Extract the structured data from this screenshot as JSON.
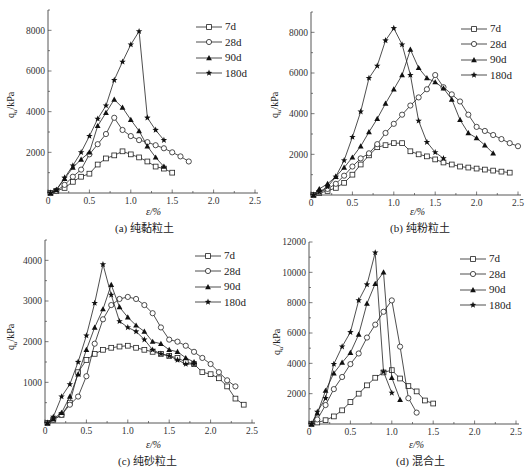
{
  "figure": {
    "panels": [
      {
        "id": "a",
        "caption": "(a) 纯黏粒土"
      },
      {
        "id": "b",
        "caption": "(b) 纯粉粒土"
      },
      {
        "id": "c",
        "caption": "(c) 纯砂粒土"
      },
      {
        "id": "d",
        "caption": "(d) 混合土"
      }
    ],
    "xlabel": "ε/%",
    "ylabel": "qu/kPa",
    "legend": [
      "7d",
      "28d",
      "90d",
      "180d"
    ],
    "markers": {
      "7d": "open-square",
      "28d": "open-circle",
      "90d": "filled-triangle",
      "180d": "filled-star"
    }
  },
  "chart_data": [
    {
      "type": "line",
      "title": "(a) 纯黏粒土",
      "xlabel": "ε/%",
      "ylabel": "qu/kPa",
      "xlim": [
        0,
        2.5
      ],
      "ylim": [
        0,
        9000
      ],
      "xticks": [
        0,
        0.5,
        1.0,
        1.5,
        2.0,
        2.5
      ],
      "yticks": [
        2000,
        4000,
        6000,
        8000
      ],
      "legend_position": "upper right",
      "series": [
        {
          "name": "7d",
          "x": [
            0.03,
            0.1,
            0.2,
            0.3,
            0.4,
            0.5,
            0.6,
            0.7,
            0.8,
            0.9,
            1.0,
            1.1,
            1.2,
            1.3,
            1.4,
            1.5
          ],
          "y": [
            0,
            100,
            250,
            550,
            800,
            950,
            1400,
            1700,
            1850,
            2050,
            1900,
            1750,
            1550,
            1300,
            1200,
            1000
          ]
        },
        {
          "name": "28d",
          "x": [
            0.03,
            0.1,
            0.2,
            0.3,
            0.4,
            0.5,
            0.6,
            0.7,
            0.8,
            0.9,
            1.0,
            1.1,
            1.2,
            1.3,
            1.4,
            1.5,
            1.6,
            1.7
          ],
          "y": [
            0,
            100,
            400,
            800,
            1150,
            1900,
            2400,
            2900,
            3700,
            3100,
            2800,
            2600,
            2500,
            2350,
            2200,
            2000,
            1800,
            1550
          ]
        },
        {
          "name": "90d",
          "x": [
            0.03,
            0.1,
            0.2,
            0.3,
            0.4,
            0.5,
            0.6,
            0.7,
            0.8,
            0.9,
            1.0,
            1.1,
            1.2,
            1.3,
            1.4
          ],
          "y": [
            0,
            150,
            700,
            1250,
            1650,
            2000,
            3300,
            3950,
            4600,
            4200,
            3600,
            3050,
            2300,
            1750,
            1300
          ]
        },
        {
          "name": "180d",
          "x": [
            0.03,
            0.1,
            0.2,
            0.3,
            0.4,
            0.5,
            0.6,
            0.7,
            0.8,
            0.9,
            1.0,
            1.1,
            1.2,
            1.3,
            1.4
          ],
          "y": [
            0,
            150,
            750,
            1350,
            2000,
            2800,
            3650,
            4300,
            5550,
            6450,
            7300,
            7950,
            3700,
            3100,
            2600
          ]
        }
      ]
    },
    {
      "type": "line",
      "title": "(b) 纯粉粒土",
      "xlabel": "ε/%",
      "ylabel": "qu/kPa",
      "xlim": [
        0,
        2.5
      ],
      "ylim": [
        0,
        9000
      ],
      "xticks": [
        0,
        0.5,
        1.0,
        1.5,
        2.0,
        2.5
      ],
      "yticks": [
        2000,
        4000,
        6000,
        8000
      ],
      "legend_position": "upper right",
      "series": [
        {
          "name": "7d",
          "x": [
            0.03,
            0.1,
            0.2,
            0.3,
            0.4,
            0.5,
            0.6,
            0.7,
            0.8,
            0.9,
            1.0,
            1.1,
            1.2,
            1.3,
            1.4,
            1.5,
            1.6,
            1.7,
            1.8,
            1.9,
            2.0,
            2.1,
            2.2,
            2.3,
            2.4
          ],
          "y": [
            0,
            100,
            200,
            350,
            600,
            1000,
            1500,
            1950,
            2350,
            2450,
            2550,
            2550,
            2150,
            2000,
            1900,
            1750,
            1600,
            1500,
            1400,
            1350,
            1300,
            1250,
            1200,
            1150,
            1100
          ]
        },
        {
          "name": "28d",
          "x": [
            0.03,
            0.1,
            0.2,
            0.3,
            0.4,
            0.5,
            0.6,
            0.7,
            0.8,
            0.9,
            1.0,
            1.1,
            1.2,
            1.3,
            1.4,
            1.5,
            1.6,
            1.7,
            1.8,
            1.9,
            2.0,
            2.1,
            2.2,
            2.3,
            2.4,
            2.5
          ],
          "y": [
            0,
            150,
            300,
            550,
            950,
            1400,
            1800,
            2050,
            2500,
            3050,
            3500,
            3950,
            4400,
            4800,
            5200,
            5900,
            5300,
            4950,
            4600,
            3950,
            3350,
            3150,
            2950,
            2750,
            2550,
            2400
          ]
        },
        {
          "name": "90d",
          "x": [
            0.03,
            0.1,
            0.2,
            0.3,
            0.4,
            0.5,
            0.6,
            0.7,
            0.8,
            0.9,
            1.0,
            1.1,
            1.2,
            1.3,
            1.4,
            1.5,
            1.6,
            1.7,
            1.8,
            1.9,
            2.0,
            2.1,
            2.2
          ],
          "y": [
            0,
            300,
            550,
            900,
            1350,
            1850,
            2400,
            3100,
            3750,
            4500,
            5200,
            5900,
            7150,
            6250,
            5750,
            5550,
            5250,
            4700,
            3700,
            3050,
            2800,
            2450,
            2050
          ]
        },
        {
          "name": "180d",
          "x": [
            0.03,
            0.1,
            0.2,
            0.3,
            0.4,
            0.5,
            0.6,
            0.7,
            0.8,
            0.9,
            1.0,
            1.1,
            1.2,
            1.3,
            1.4,
            1.5,
            1.6
          ],
          "y": [
            0,
            150,
            400,
            900,
            1700,
            2850,
            4100,
            5750,
            6350,
            7600,
            8200,
            7400,
            5900,
            3650,
            2600,
            2100,
            1800
          ]
        }
      ]
    },
    {
      "type": "line",
      "title": "(c) 纯砂粒土",
      "xlabel": "ε/%",
      "ylabel": "qu/kPa",
      "xlim": [
        0,
        2.5
      ],
      "ylim": [
        0,
        4500
      ],
      "xticks": [
        0,
        0.5,
        1.0,
        1.5,
        2.0,
        2.5
      ],
      "yticks": [
        1000,
        2000,
        3000,
        4000
      ],
      "legend_position": "upper right",
      "series": [
        {
          "name": "7d",
          "x": [
            0.03,
            0.1,
            0.2,
            0.3,
            0.4,
            0.5,
            0.6,
            0.7,
            0.8,
            0.9,
            1.0,
            1.1,
            1.2,
            1.3,
            1.4,
            1.5,
            1.6,
            1.7,
            1.8,
            1.9,
            2.0,
            2.1,
            2.2,
            2.3,
            2.4
          ],
          "y": [
            0,
            80,
            200,
            500,
            1250,
            1550,
            1700,
            1800,
            1850,
            1880,
            1900,
            1850,
            1800,
            1750,
            1700,
            1650,
            1600,
            1500,
            1450,
            1250,
            1200,
            1100,
            900,
            600,
            450
          ]
        },
        {
          "name": "28d",
          "x": [
            0.03,
            0.1,
            0.2,
            0.3,
            0.4,
            0.5,
            0.6,
            0.7,
            0.8,
            0.9,
            1.0,
            1.1,
            1.2,
            1.3,
            1.4,
            1.5,
            1.6,
            1.7,
            1.8,
            1.9,
            2.0,
            2.1,
            2.2,
            2.3
          ],
          "y": [
            0,
            80,
            200,
            450,
            650,
            1150,
            1950,
            2550,
            2900,
            3050,
            3100,
            3050,
            2900,
            2700,
            2350,
            2050,
            2000,
            1900,
            1750,
            1600,
            1450,
            1250,
            1050,
            900
          ]
        },
        {
          "name": "90d",
          "x": [
            0.03,
            0.1,
            0.2,
            0.3,
            0.4,
            0.5,
            0.6,
            0.7,
            0.8,
            0.9,
            1.0,
            1.1,
            1.2,
            1.3,
            1.4,
            1.5,
            1.6,
            1.7,
            1.8
          ],
          "y": [
            0,
            100,
            250,
            650,
            1200,
            1800,
            2350,
            2800,
            3400,
            2850,
            2600,
            2400,
            2250,
            2000,
            1950,
            1800,
            1750,
            1600,
            1500
          ]
        },
        {
          "name": "180d",
          "x": [
            0.03,
            0.1,
            0.2,
            0.3,
            0.4,
            0.5,
            0.6,
            0.7,
            0.8,
            0.9,
            1.0,
            1.1,
            1.2,
            1.3,
            1.4,
            1.5,
            1.6,
            1.7,
            1.8
          ],
          "y": [
            0,
            150,
            650,
            950,
            1500,
            2150,
            2950,
            3900,
            3150,
            2500,
            2350,
            2250,
            2050,
            1800,
            1700,
            1650,
            1550,
            1450,
            1450
          ]
        }
      ]
    },
    {
      "type": "line",
      "title": "(d) 混合土",
      "xlabel": "ε/%",
      "ylabel": "qu/kPa",
      "xlim": [
        0,
        2.5
      ],
      "ylim": [
        0,
        12000
      ],
      "xticks": [
        0,
        0.5,
        1.0,
        1.5,
        2.0,
        2.5
      ],
      "yticks": [
        2000,
        4000,
        6000,
        8000,
        10000,
        12000
      ],
      "legend_position": "upper right",
      "series": [
        {
          "name": "7d",
          "x": [
            0.03,
            0.1,
            0.2,
            0.3,
            0.4,
            0.5,
            0.6,
            0.7,
            0.8,
            0.9,
            1.0,
            1.1,
            1.2,
            1.3,
            1.4,
            1.5
          ],
          "y": [
            0,
            100,
            250,
            500,
            900,
            1450,
            2000,
            2550,
            3050,
            3400,
            3550,
            3000,
            2500,
            2150,
            1550,
            1350
          ]
        },
        {
          "name": "28d",
          "x": [
            0.03,
            0.1,
            0.2,
            0.3,
            0.4,
            0.5,
            0.6,
            0.7,
            0.8,
            0.9,
            1.0,
            1.1,
            1.2,
            1.3
          ],
          "y": [
            0,
            300,
            1250,
            2300,
            3100,
            3950,
            4650,
            5700,
            6550,
            7400,
            8150,
            5100,
            1700,
            750
          ]
        },
        {
          "name": "90d",
          "x": [
            0.03,
            0.1,
            0.2,
            0.3,
            0.4,
            0.5,
            0.6,
            0.7,
            0.8,
            0.9,
            1.0,
            1.1
          ],
          "y": [
            0,
            700,
            2200,
            3350,
            4050,
            4700,
            5900,
            7950,
            9250,
            10000,
            3050,
            1600
          ]
        },
        {
          "name": "180d",
          "x": [
            0.03,
            0.1,
            0.2,
            0.3,
            0.4,
            0.5,
            0.6,
            0.7,
            0.8,
            0.9,
            1.0
          ],
          "y": [
            0,
            800,
            1700,
            3950,
            5100,
            6050,
            8150,
            9200,
            11300,
            3450,
            2050
          ]
        }
      ]
    }
  ]
}
